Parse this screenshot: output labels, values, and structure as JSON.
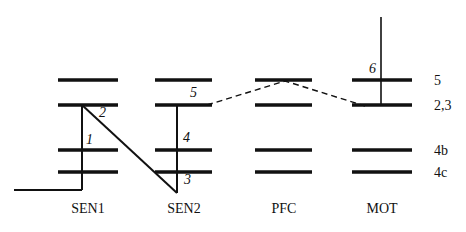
{
  "figure": {
    "type": "energy-level-diagram",
    "background_color": "#ffffff",
    "line_color": "#111111"
  },
  "chart_data": {
    "type": "diagram",
    "title": "",
    "xlabel": "",
    "ylabel": "",
    "columns": [
      "SEN1",
      "SEN2",
      "PFC",
      "MOT"
    ],
    "level_rows": [
      "5",
      "2,3",
      "4b",
      "4c"
    ],
    "levels": [
      {
        "column": "SEN1",
        "row": "5",
        "x1": 58,
        "x2": 118,
        "y": 80
      },
      {
        "column": "SEN1",
        "row": "2,3",
        "x1": 58,
        "x2": 118,
        "y": 105
      },
      {
        "column": "SEN1",
        "row": "4b",
        "x1": 58,
        "x2": 118,
        "y": 150
      },
      {
        "column": "SEN1",
        "row": "4c",
        "x1": 58,
        "x2": 118,
        "y": 172
      },
      {
        "column": "SEN2",
        "row": "5",
        "x1": 155,
        "x2": 212,
        "y": 80
      },
      {
        "column": "SEN2",
        "row": "2,3",
        "x1": 155,
        "x2": 212,
        "y": 105
      },
      {
        "column": "SEN2",
        "row": "4b",
        "x1": 155,
        "x2": 212,
        "y": 150
      },
      {
        "column": "SEN2",
        "row": "4c",
        "x1": 155,
        "x2": 212,
        "y": 172
      },
      {
        "column": "PFC",
        "row": "5",
        "x1": 255,
        "x2": 312,
        "y": 80
      },
      {
        "column": "PFC",
        "row": "2,3",
        "x1": 255,
        "x2": 312,
        "y": 105
      },
      {
        "column": "PFC",
        "row": "4b",
        "x1": 255,
        "x2": 312,
        "y": 150
      },
      {
        "column": "PFC",
        "row": "4c",
        "x1": 255,
        "x2": 312,
        "y": 172
      },
      {
        "column": "MOT",
        "row": "5",
        "x1": 352,
        "x2": 412,
        "y": 80
      },
      {
        "column": "MOT",
        "row": "2,3",
        "x1": 352,
        "x2": 412,
        "y": 105
      },
      {
        "column": "MOT",
        "row": "4b",
        "x1": 352,
        "x2": 412,
        "y": 150
      },
      {
        "column": "MOT",
        "row": "4c",
        "x1": 352,
        "x2": 412,
        "y": 172
      }
    ],
    "connections": [
      {
        "id": "1",
        "style": "solid",
        "from": "SEN1 2,3",
        "to": "SEN1 baseline"
      },
      {
        "id": "2",
        "style": "solid",
        "from": "SEN1 2,3",
        "to": "SEN2 bottom"
      },
      {
        "id": "3",
        "style": "solid",
        "from": "SEN2 2,3",
        "to": "SEN2 bottom"
      },
      {
        "id": "4",
        "style": "solid",
        "from": "SEN2 2,3",
        "to": "SEN2 4c"
      },
      {
        "id": "5",
        "style": "dashed",
        "from": "SEN2 2,3",
        "to": "PFC 5"
      },
      {
        "id": "6",
        "style": "solid",
        "from": "MOT top",
        "to": "MOT 2,3"
      }
    ]
  },
  "row_labels": [
    {
      "text": "5",
      "x": 434,
      "y": 74
    },
    {
      "text": "2,3",
      "x": 434,
      "y": 99
    },
    {
      "text": "4b",
      "x": 434,
      "y": 144
    },
    {
      "text": "4c",
      "x": 434,
      "y": 166
    }
  ],
  "column_labels": [
    {
      "text": "SEN1",
      "center_x": 88,
      "y": 202
    },
    {
      "text": "SEN2",
      "center_x": 184,
      "y": 202
    },
    {
      "text": "PFC",
      "center_x": 284,
      "y": 202
    },
    {
      "text": "MOT",
      "center_x": 382,
      "y": 202
    }
  ],
  "number_labels": [
    {
      "text": "1",
      "x": 86,
      "y": 133
    },
    {
      "text": "2",
      "x": 99,
      "y": 106
    },
    {
      "text": "3",
      "x": 184,
      "y": 173
    },
    {
      "text": "4",
      "x": 183,
      "y": 131
    },
    {
      "text": "5",
      "x": 190,
      "y": 86
    },
    {
      "text": "6",
      "x": 369,
      "y": 62
    }
  ]
}
